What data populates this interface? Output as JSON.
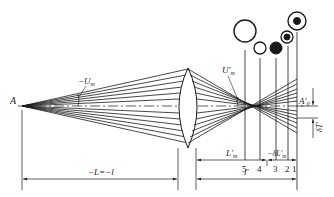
{
  "diagram": {
    "type": "optical spherical aberration diagram",
    "labels": {
      "object_point": "A",
      "object_aperture_angle": "−U",
      "object_aperture_sub": "m",
      "image_aperture_angle": "U′",
      "image_aperture_sub": "m",
      "paraxial_image_point": "A′",
      "paraxial_image_sub": "0",
      "transverse_aberration": "δT′",
      "object_distance": "−L=−l",
      "marginal_image_distance": "L′",
      "marginal_image_sub": "m",
      "longitudinal_aberration": "−δL′",
      "longitudinal_aberration_sub": "m",
      "paraxial_image_distance": "l′"
    },
    "image_planes": [
      {
        "number": "5",
        "spot": "large ring"
      },
      {
        "number": "4",
        "spot": "small ring"
      },
      {
        "number": "3",
        "spot": "filled dot"
      },
      {
        "number": "2",
        "spot": "dot with halo"
      },
      {
        "number": "1",
        "spot": "dot with large halo"
      }
    ]
  }
}
